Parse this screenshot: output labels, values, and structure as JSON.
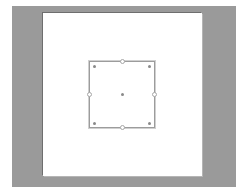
{
  "workspace": {
    "background": "#9a9a9a"
  },
  "canvas": {
    "background": "#ffffff"
  },
  "selection": {
    "shape": "square",
    "stroke": "#9c9c9c",
    "handles": [
      "top-middle",
      "bottom-middle",
      "left-middle",
      "right-middle"
    ],
    "control_points": [
      "top-left",
      "top-right",
      "bottom-left",
      "bottom-right",
      "center"
    ]
  }
}
